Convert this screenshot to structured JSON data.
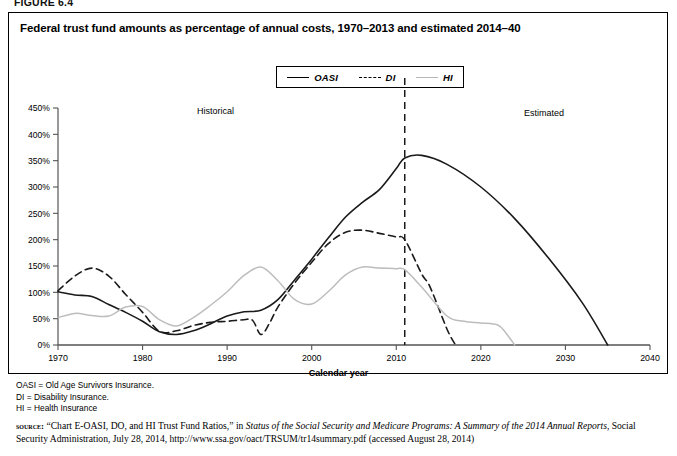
{
  "figure": {
    "label": "FIGURE 6.4",
    "title": "Federal trust fund amounts as percentage of annual costs, 1970–2013 and estimated 2014–40"
  },
  "annotations": {
    "historical": "Historical",
    "estimated": "Estimated",
    "divider_year": 2011
  },
  "footnotes": [
    "OASI = Old Age Survivors Insurance.",
    "DI = Disability Insurance.",
    "HI = Health Insurance"
  ],
  "source": {
    "kicker": "source:",
    "part1": "“Chart E-OASI, DO, and HI Trust Fund Ratios,” in ",
    "italic1": "Status of the Social Security and Medicare Programs: A Summary of the 2014 Annual Reports",
    "part2": ", Social Security Administration, July 28, 2014, http://www.ssa.gov/oact/TRSUM/tr14summary.pdf (accessed August 28, 2014)"
  },
  "chart_data": {
    "type": "line",
    "title": "Federal trust fund amounts as percentage of annual costs, 1970–2013 and estimated 2014–40",
    "xlabel": "Calendar year",
    "ylabel": "",
    "xlim": [
      1970,
      2040
    ],
    "ylim": [
      0,
      450
    ],
    "xticks": [
      1970,
      1980,
      1990,
      2000,
      2010,
      2020,
      2030,
      2040
    ],
    "xticklabels": [
      "1970",
      "1980",
      "1990",
      "2000",
      "2010",
      "2020",
      "2030",
      "2040"
    ],
    "yticks": [
      0,
      50,
      100,
      150,
      200,
      250,
      300,
      350,
      400,
      450
    ],
    "yticklabels": [
      "0%",
      "50%",
      "100%",
      "150%",
      "200%",
      "250%",
      "300%",
      "350%",
      "400%",
      "450%"
    ],
    "grid": false,
    "legend_position": "top-center",
    "series": [
      {
        "name": "OASI",
        "style": "solid",
        "color": "#1a1a1a",
        "x": [
          1970,
          1972,
          1974,
          1976,
          1978,
          1980,
          1982,
          1984,
          1986,
          1988,
          1990,
          1992,
          1994,
          1996,
          1998,
          2000,
          2002,
          2004,
          2006,
          2008,
          2010,
          2011,
          2013,
          2016,
          2020,
          2024,
          2028,
          2032,
          2035
        ],
        "values": [
          101,
          95,
          92,
          77,
          62,
          45,
          25,
          20,
          27,
          40,
          55,
          63,
          66,
          86,
          124,
          163,
          204,
          243,
          271,
          295,
          335,
          355,
          360,
          343,
          300,
          240,
          165,
          80,
          0
        ]
      },
      {
        "name": "DI",
        "style": "dashed",
        "color": "#1a1a1a",
        "x": [
          1970,
          1972,
          1974,
          1976,
          1978,
          1980,
          1982,
          1984,
          1986,
          1988,
          1990,
          1992,
          1993,
          1994,
          1995,
          1996,
          1998,
          2000,
          2002,
          2004,
          2006,
          2008,
          2010,
          2011,
          2013,
          2014,
          2016,
          2017
        ],
        "values": [
          103,
          131,
          146,
          131,
          96,
          62,
          26,
          27,
          37,
          43,
          45,
          48,
          47,
          20,
          41,
          72,
          118,
          157,
          193,
          214,
          218,
          212,
          205,
          200,
          135,
          110,
          30,
          0
        ]
      },
      {
        "name": "HI",
        "style": "dotted",
        "color": "#bdbdbd",
        "x": [
          1970,
          1972,
          1974,
          1976,
          1978,
          1980,
          1982,
          1984,
          1986,
          1988,
          1990,
          1992,
          1994,
          1996,
          1998,
          2000,
          2002,
          2004,
          2006,
          2008,
          2010,
          2011,
          2013,
          2016,
          2018,
          2020,
          2022,
          2023,
          2024
        ],
        "values": [
          52,
          60,
          56,
          55,
          72,
          73,
          48,
          36,
          52,
          75,
          101,
          132,
          148,
          122,
          86,
          78,
          102,
          133,
          148,
          146,
          145,
          143,
          110,
          55,
          45,
          42,
          38,
          22,
          0
        ]
      }
    ]
  }
}
